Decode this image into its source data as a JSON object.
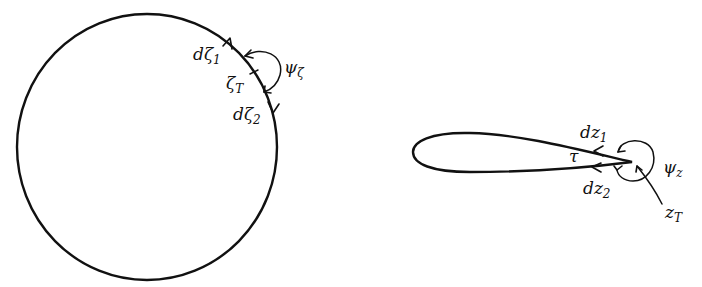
{
  "figure": {
    "left_panel": {
      "shape": "circle",
      "labels": {
        "d_zeta_1": "dζ",
        "d_zeta_1_sub": "1",
        "zeta_T": "ζ",
        "zeta_T_sub": "T",
        "psi_zeta": "ψ",
        "psi_zeta_sub": "ζ",
        "d_zeta_2": "dζ",
        "d_zeta_2_sub": "2"
      }
    },
    "right_panel": {
      "shape": "airfoil",
      "labels": {
        "dz_1": "dz",
        "dz_1_sub": "1",
        "tau": "τ",
        "psi_z": "ψ",
        "psi_z_sub": "z",
        "dz_2": "dz",
        "dz_2_sub": "2",
        "z_T": "z",
        "z_T_sub": "T"
      }
    },
    "colors": {
      "stroke": "#111111",
      "background": "#ffffff"
    }
  }
}
